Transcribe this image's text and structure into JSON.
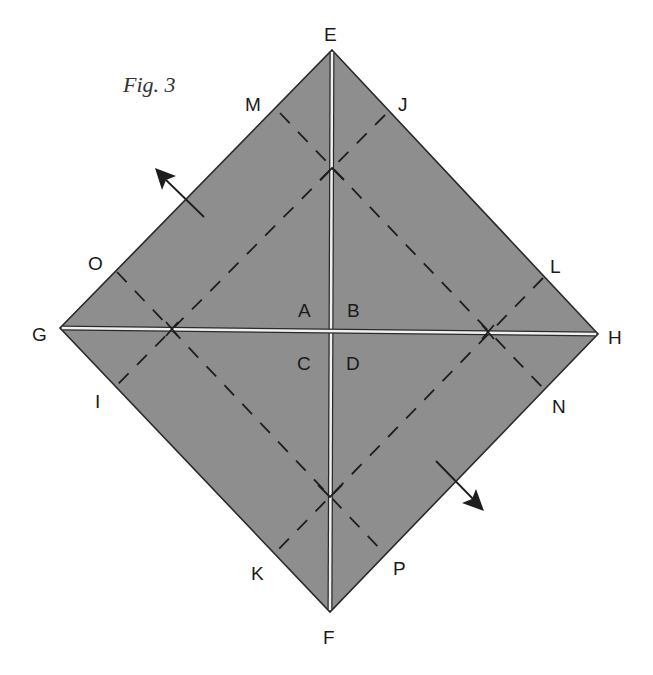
{
  "figure": {
    "title": "Fig. 3",
    "colors": {
      "paper": "#8e8e8e",
      "edge": "#2a2a2a",
      "crease_highlight": "#f0f0f0",
      "dash": "#1e1e1e",
      "background": "#ffffff"
    },
    "vertices": {
      "E": "E",
      "F": "F",
      "G": "G",
      "H": "H"
    },
    "quadrants": {
      "A": "A",
      "B": "B",
      "C": "C",
      "D": "D"
    },
    "edge_points": {
      "M": "M",
      "J": "J",
      "O": "O",
      "L": "L",
      "I": "I",
      "N": "N",
      "K": "K",
      "P": "P"
    },
    "arrows": [
      {
        "name": "arrow-up-left",
        "direction": "up-left"
      },
      {
        "name": "arrow-down-right",
        "direction": "down-right"
      }
    ]
  }
}
